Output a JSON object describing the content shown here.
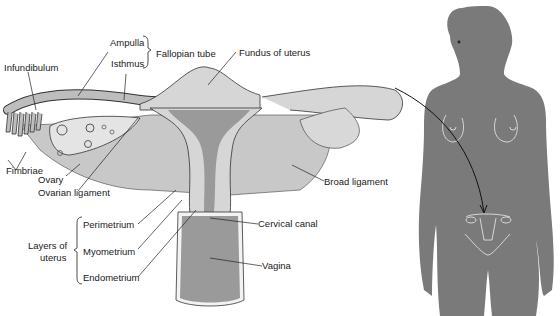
{
  "labels": {
    "ampulla": "Ampulla",
    "isthmus": "Isthmus",
    "fallopian_tube": "Fallopian tube",
    "infundibulum": "Infundibulum",
    "fundus": "Fundus of uterus",
    "fimbriae": "Fimbriae",
    "ovary": "Ovary",
    "ovarian_ligament": "Ovarian ligament",
    "broad_ligament": "Broad ligament",
    "perimetrium": "Perimetrium",
    "myometrium": "Myometrium",
    "endometrium": "Endometrium",
    "layers_of_uterus_1": "Layers of",
    "layers_of_uterus_2": "uterus",
    "cervical_canal": "Cervical canal",
    "vagina": "Vagina"
  },
  "colors": {
    "silhouette": "#7a7a7a",
    "cavity": "#9a9a9a",
    "tissue": "#d6d6d6",
    "ligament": "#c8c8c8",
    "line": "#222222",
    "outline_white": "#f2f2f2"
  }
}
